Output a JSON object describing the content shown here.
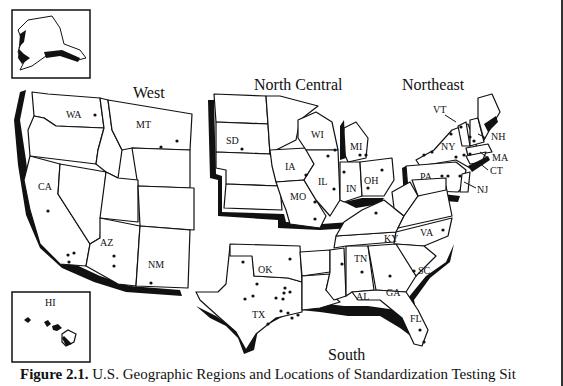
{
  "figure": {
    "caption_label": "Figure 2.1.",
    "caption_text": " U.S. Geographic Regions and Locations of Standardization Testing Sit"
  },
  "regions": {
    "west": "West",
    "north_central": "North Central",
    "northeast": "Northeast",
    "south": "South"
  },
  "states": {
    "WA": "WA",
    "MT": "MT",
    "CA": "CA",
    "AZ": "AZ",
    "NM": "NM",
    "HI": "HI",
    "SD": "SD",
    "WI": "WI",
    "MI": "MI",
    "IA": "IA",
    "IL": "IL",
    "IN": "IN",
    "OH": "OH",
    "MO": "MO",
    "VT": "VT",
    "NH": "NH",
    "NY": "NY",
    "MA": "MA",
    "CT": "CT",
    "PA": "PA",
    "NJ": "NJ",
    "OK": "OK",
    "TX": "TX",
    "KY": "KY",
    "VA": "VA",
    "TN": "TN",
    "AL": "AL",
    "GA": "GA",
    "SC": "SC",
    "FL": "FL"
  },
  "insets": [
    "Alaska",
    "Hawaii"
  ],
  "colors": {
    "ink": "#111111",
    "paper": "#ffffff"
  }
}
